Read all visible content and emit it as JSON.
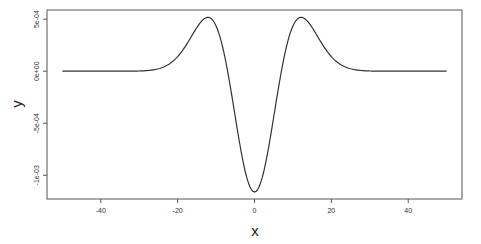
{
  "chart_data": {
    "type": "line",
    "title": "",
    "xlabel": "x",
    "ylabel": "y",
    "xlim": [
      -54,
      54
    ],
    "ylim": [
      -0.001228,
      0.000588
    ],
    "grid": false,
    "legend": null,
    "x_ticks": [
      -40,
      -20,
      0,
      20,
      40
    ],
    "x_tick_labels": [
      "-40",
      "-20",
      "0",
      "20",
      "40"
    ],
    "y_ticks": [
      0.0005,
      0.0,
      -0.0005,
      -0.001
    ],
    "y_tick_labels": [
      "5e-04",
      "0e+00",
      "-5e-04",
      "-1e-03"
    ],
    "series": [
      {
        "name": "y",
        "function": "Ricker-like wavelet: A*(x^2/s^2 - 1)*exp(-x^2/(2 s^2)), A=1.16e-3, s=7",
        "x": [
          -50,
          -40,
          -30,
          -25,
          -20,
          -16,
          -14,
          -12,
          -10,
          -8,
          -6,
          -4,
          -2,
          0,
          2,
          4,
          6,
          8,
          10,
          12,
          14,
          16,
          20,
          25,
          30,
          40,
          50
        ],
        "y": [
          0.0,
          0.0,
          2e-06,
          2.1e-05,
          0.000125,
          0.000326,
          0.000408,
          0.000518,
          0.000426,
          0.000186,
          -0.000182,
          -0.000586,
          -0.000977,
          -0.00116,
          -0.000977,
          -0.000586,
          -0.000182,
          0.000186,
          0.000426,
          0.000518,
          0.000408,
          0.000326,
          0.000125,
          2.1e-05,
          2e-06,
          0.0,
          0.0
        ]
      }
    ]
  },
  "plot": {
    "line_color": "#333333",
    "box_color": "#555555"
  }
}
